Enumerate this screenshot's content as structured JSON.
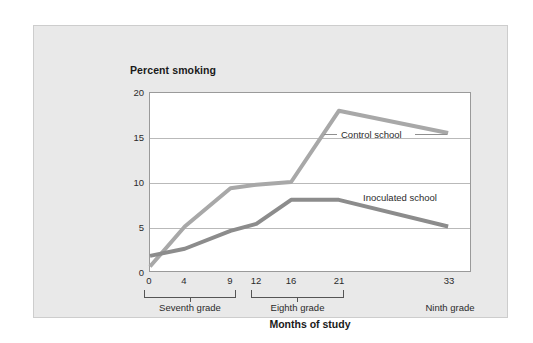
{
  "chart_data": {
    "type": "line",
    "title": "Percent smoking",
    "xlabel": "Months of study",
    "ylabel": "Percent smoking",
    "x": [
      0,
      4,
      9,
      12,
      16,
      21,
      33
    ],
    "xtick_labels": [
      "0",
      "4",
      "9",
      "12",
      "16",
      "21",
      "33"
    ],
    "ytick_labels": [
      "0",
      "5",
      "10",
      "15",
      "20"
    ],
    "yticks": [
      0,
      5,
      10,
      15,
      20
    ],
    "ylim": [
      0,
      20
    ],
    "grid": true,
    "legend_position": "inline-annotations",
    "series": [
      {
        "name": "Control school",
        "color": "#a8a8a8",
        "values": [
          0.5,
          5.0,
          9.3,
          9.7,
          10.0,
          18.0,
          15.5
        ]
      },
      {
        "name": "Inoculated school",
        "color": "#8c8c8c",
        "values": [
          1.7,
          2.5,
          4.5,
          5.3,
          8.0,
          8.0,
          5.0
        ]
      }
    ],
    "annotations": [
      {
        "text": "Control school",
        "has_leader_line": true
      },
      {
        "text": "Inoculated school",
        "has_leader_line": false
      }
    ],
    "grade_brackets": [
      {
        "label": "Seventh grade",
        "months_from": 0,
        "months_to": 9,
        "bracket": true
      },
      {
        "label": "Eighth grade",
        "months_from": 12,
        "months_to": 21,
        "bracket": true
      },
      {
        "label": "Ninth grade",
        "months_from": 33,
        "months_to": 33,
        "bracket": false
      }
    ]
  },
  "colors": {
    "panel_background": "#e9e9e9",
    "plot_background": "#ffffff",
    "gridline": "#b9b9b9",
    "control_series": "#a8a8a8",
    "inoculated_series": "#8c8c8c",
    "text": "#2b2b2b"
  }
}
